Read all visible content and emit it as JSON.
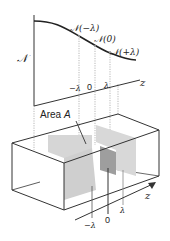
{
  "graph": {
    "y_axis_label": "𝒩",
    "x_axis_label": "z",
    "curve_labels": [
      "𝒩(−λ)",
      "𝒩(0)",
      "𝒩(+λ)"
    ],
    "tick_labels": [
      "−λ",
      "0",
      "λ"
    ]
  },
  "box": {
    "area_label_text": "Area ",
    "area_label_var": "A",
    "axis_label": "z",
    "tick_labels": [
      "−λ",
      "0",
      "λ"
    ]
  },
  "colors": {
    "line": "#333333",
    "plane_light": "#d6d6d6",
    "plane_dark": "#9e9e9e",
    "dotted": "#999999"
  }
}
